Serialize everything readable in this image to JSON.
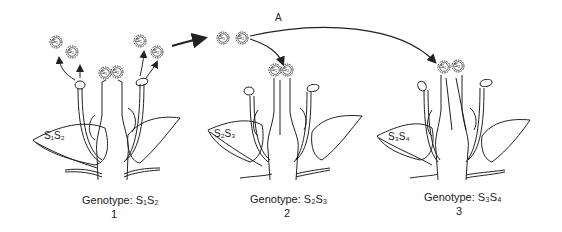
{
  "diagram": {
    "arrow_label": "A",
    "flowers": [
      {
        "index": "1",
        "genotype_label": "Genotype:",
        "genotype": "S₁S₂",
        "ovary_label": "S₁S₂",
        "stigma_pollen": [
          "S₁",
          "S₂"
        ],
        "released_pollen": [
          "S₁",
          "S₂",
          "S₁",
          "S₂"
        ]
      },
      {
        "index": "2",
        "genotype_label": "Genotype:",
        "genotype": "S₂S₃",
        "ovary_label": "S₂S₃",
        "stigma_pollen": [
          "S₁",
          "S₂"
        ]
      },
      {
        "index": "3",
        "genotype_label": "Genotype:",
        "genotype": "S₃S₄",
        "ovary_label": "S₃S₄",
        "stigma_pollen": [
          "S₁",
          "S₂"
        ]
      }
    ],
    "transfer_pollen": [
      "S₁",
      "S₂"
    ]
  }
}
